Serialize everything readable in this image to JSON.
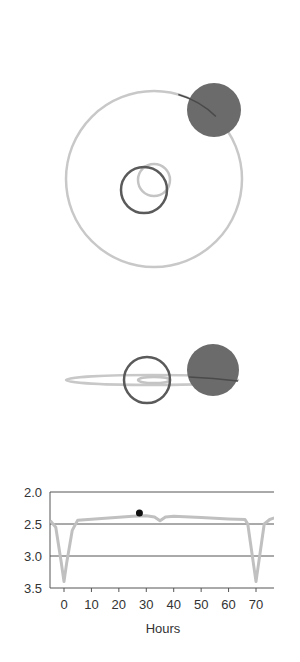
{
  "figure": {
    "top_view": {
      "orbit": {
        "cx": 154,
        "cy": 179,
        "r": 88,
        "color": "#c8c8c8"
      },
      "inner_orbit": {
        "cx": 154,
        "cy": 180,
        "r": 16,
        "color": "#c4c4c4"
      },
      "companion_star": {
        "cx": 144,
        "cy": 190,
        "r": 23,
        "color": "#5a5a5a"
      },
      "primary_star": {
        "cx": 214,
        "cy": 110,
        "r": 27,
        "color": "#6b6b6b"
      }
    },
    "side_view": {
      "orbit": {
        "cx": 152,
        "cy": 380,
        "rx": 86,
        "ry": 5,
        "color": "#c8c8c8"
      },
      "inner_orbit": {
        "cx": 154,
        "cy": 380,
        "rx": 16,
        "ry": 3,
        "color": "#c4c4c4"
      },
      "companion_star": {
        "cx": 147,
        "cy": 380,
        "r": 23,
        "color": "#5a5a5a"
      },
      "primary_star": {
        "cx": 213,
        "cy": 370,
        "r": 26,
        "color": "#6b6b6b"
      }
    }
  },
  "chart_data": {
    "type": "line",
    "title": "",
    "xlabel": "Hours",
    "ylabel": "",
    "x_ticks": [
      0,
      10,
      20,
      30,
      40,
      50,
      60,
      70
    ],
    "y_ticks": [
      2.0,
      2.5,
      3.0,
      3.5
    ],
    "y_tick_labels": [
      "2.0",
      "2.5",
      "3.0",
      "3.5"
    ],
    "xlim": [
      -5,
      77
    ],
    "ylim": [
      3.5,
      2.0
    ],
    "y_inverted": true,
    "grid": {
      "horizontal_lines_at": [
        2.0,
        2.5,
        3.0
      ]
    },
    "series": [
      {
        "name": "light curve (magnitude)",
        "color": "#c0c0c0",
        "x": [
          -5,
          -3,
          -1,
          0,
          1,
          3,
          5,
          15,
          25,
          30,
          33,
          35,
          37,
          40,
          50,
          60,
          66,
          67,
          68,
          69,
          70,
          71,
          72,
          73,
          75,
          77
        ],
        "y": [
          2.45,
          2.55,
          3.1,
          3.4,
          3.1,
          2.6,
          2.44,
          2.41,
          2.38,
          2.37,
          2.39,
          2.45,
          2.39,
          2.38,
          2.4,
          2.42,
          2.43,
          2.5,
          2.8,
          3.1,
          3.4,
          3.1,
          2.8,
          2.5,
          2.43,
          2.4
        ]
      }
    ],
    "marker": {
      "x": 27.5,
      "y": 2.33,
      "color": "#111111",
      "label": "current phase"
    }
  },
  "axis_labels": {
    "x_title": "Hours",
    "x_ticks": [
      "0",
      "10",
      "20",
      "30",
      "40",
      "50",
      "60",
      "70"
    ],
    "y_ticks": [
      "2.0",
      "2.5",
      "3.0",
      "3.5"
    ]
  }
}
